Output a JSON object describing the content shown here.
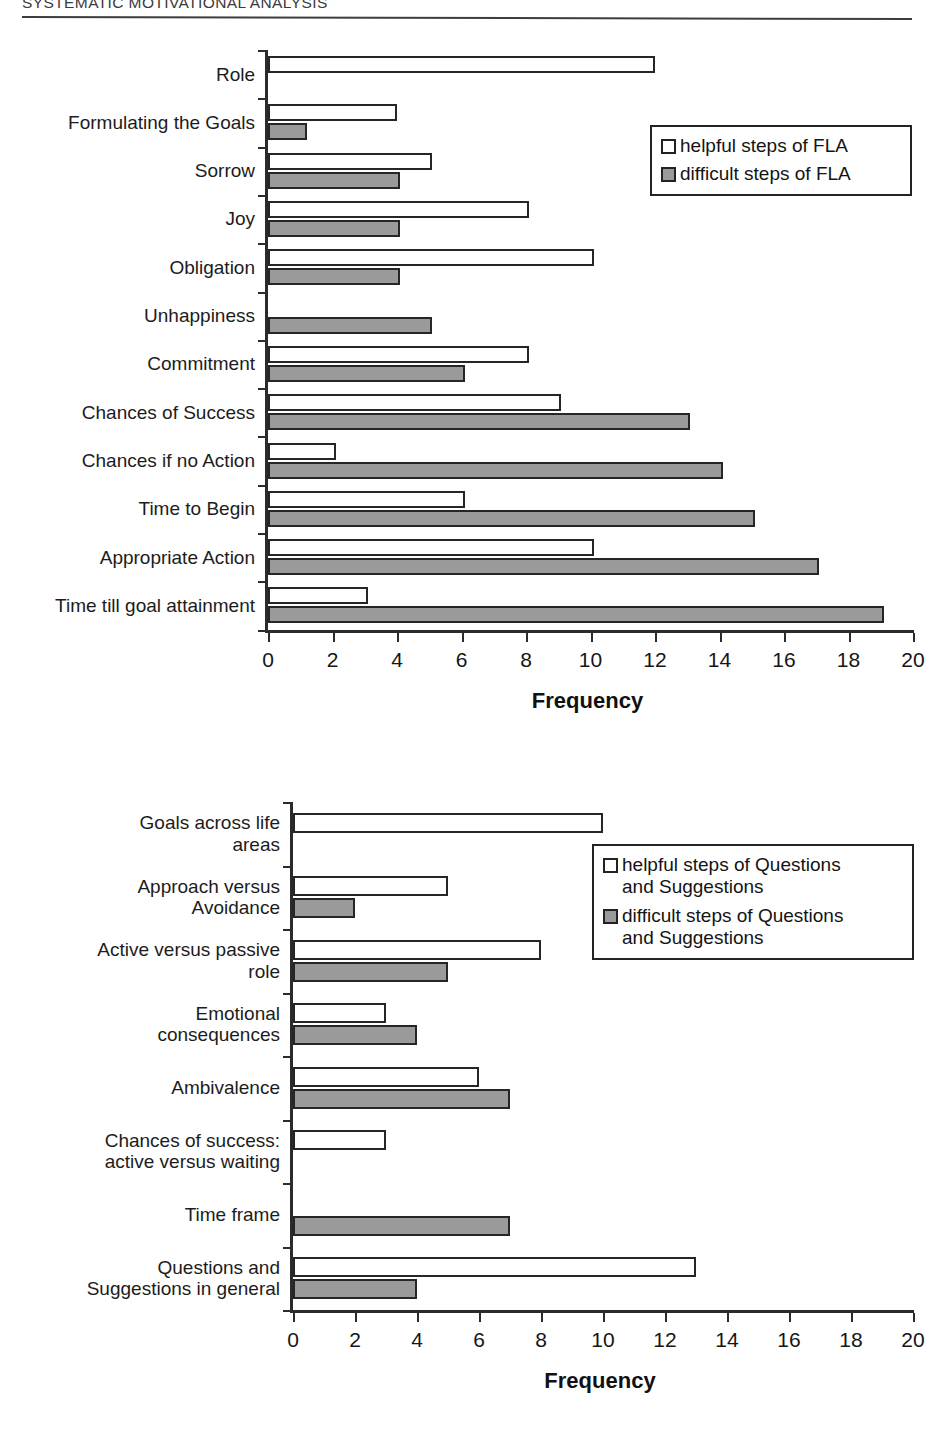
{
  "header": {
    "running_title": "SYSTEMATIC MOTIVATIONAL ANALYSIS"
  },
  "colors": {
    "helpful_fill": "#ffffff",
    "difficult_fill": "#9a9a9a",
    "stroke": "#262626",
    "text": "#1a1a1a"
  },
  "figures": [
    {
      "id": "figure-1",
      "xlabel": "Frequency",
      "legend": {
        "items": [
          {
            "label": "helpful steps of FLA",
            "swatch": "helpful"
          },
          {
            "label": "difficult steps of FLA",
            "swatch": "difficult"
          }
        ]
      }
    },
    {
      "id": "figure-2",
      "xlabel": "Frequency",
      "legend": {
        "items": [
          {
            "label": "helpful steps of Questions\nand Suggestions",
            "swatch": "helpful"
          },
          {
            "label": "difficult steps of Questions\nand Suggestions",
            "swatch": "difficult"
          }
        ]
      }
    }
  ],
  "chart_data": [
    {
      "type": "bar",
      "orientation": "horizontal",
      "title": "",
      "xlabel": "Frequency",
      "ylabel": "",
      "xlim": [
        0,
        20
      ],
      "xticks": [
        0,
        2,
        4,
        6,
        8,
        10,
        12,
        14,
        16,
        18,
        20
      ],
      "grid": false,
      "legend_position": "top-right",
      "categories": [
        "Role",
        "Formulating the Goals",
        "Sorrow",
        "Joy",
        "Obligation",
        "Unhappiness",
        "Commitment",
        "Chances of Success",
        "Chances if no Action",
        "Time to Begin",
        "Appropriate Action",
        "Time till goal attainment"
      ],
      "series": [
        {
          "name": "helpful steps of FLA",
          "values": [
            12,
            4,
            5.1,
            8.1,
            10.1,
            0,
            8.1,
            9.1,
            2.1,
            6.1,
            10.1,
            3.1
          ]
        },
        {
          "name": "difficult steps of FLA",
          "values": [
            0,
            1.2,
            4.1,
            4.1,
            4.1,
            5.1,
            6.1,
            13.1,
            14.1,
            15.1,
            17.1,
            19.1
          ]
        }
      ]
    },
    {
      "type": "bar",
      "orientation": "horizontal",
      "title": "",
      "xlabel": "Frequency",
      "ylabel": "",
      "xlim": [
        0,
        20
      ],
      "xticks": [
        0,
        2,
        4,
        6,
        8,
        10,
        12,
        14,
        16,
        18,
        20
      ],
      "grid": false,
      "legend_position": "top-right",
      "categories": [
        "Goals across life\nareas",
        "Approach versus\nAvoidance",
        "Active versus passive\nrole",
        "Emotional\nconsequences",
        "Ambivalence",
        "Chances of success:\nactive versus waiting",
        "Time frame",
        "Questions and\nSuggestions in general"
      ],
      "series": [
        {
          "name": "helpful steps of Questions and Suggestions",
          "values": [
            10,
            5,
            8,
            3,
            6,
            3,
            0,
            13
          ]
        },
        {
          "name": "difficult steps of Questions and Suggestions",
          "values": [
            0,
            2,
            5,
            4,
            7,
            0,
            7,
            4
          ]
        }
      ]
    }
  ]
}
